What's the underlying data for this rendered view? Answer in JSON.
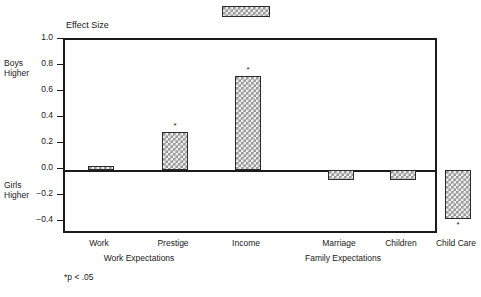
{
  "figure": {
    "legend_swatch_name": "bar-fill-pattern-swatch",
    "axis_title": "Effect Size",
    "footnote": "*p < .05",
    "side_annotations": {
      "positive": "Boys\nHigher",
      "positive_line1": "Boys",
      "positive_line2": "Higher",
      "negative_line1": "Girls",
      "negative_line2": "Higher"
    },
    "colors": {
      "frame": "#1b1b1b",
      "bar_fill": "#9a9a9a",
      "bar_pattern": "#f4f4f4",
      "bar_edge": "#2b2b2b",
      "text": "#1a1a1a",
      "background": "#ffffff"
    }
  },
  "chart_data": {
    "type": "bar",
    "title": "",
    "subtitle": "",
    "xlabel": "",
    "ylabel": "Effect Size",
    "ylim": [
      -0.5,
      1.0
    ],
    "yticks": [
      1.0,
      0.8,
      0.6,
      0.4,
      0.2,
      0.0,
      -0.2,
      -0.4
    ],
    "ytick_labels": [
      "1.0",
      "0.8",
      "0.6",
      "0.4",
      "0.2",
      "0.0",
      "−0.2",
      "−0.4"
    ],
    "grid": false,
    "legend_position": "top",
    "zero_line": 0.0,
    "categories": [
      "Work",
      "Prestige",
      "Income",
      "Marriage",
      "Children",
      "Child Care"
    ],
    "values": [
      0.03,
      0.29,
      0.72,
      -0.08,
      -0.08,
      -0.38
    ],
    "significance": [
      "",
      "*",
      "*",
      "",
      "",
      "*"
    ],
    "groups": [
      {
        "label": "Work Expectations",
        "categories": [
          "Work",
          "Prestige",
          "Income"
        ]
      },
      {
        "label": "Family Expectations",
        "categories": [
          "Marriage",
          "Children",
          "Child Care"
        ]
      }
    ],
    "annotations": [
      "Boys Higher",
      "Girls Higher",
      "*p < .05"
    ]
  }
}
